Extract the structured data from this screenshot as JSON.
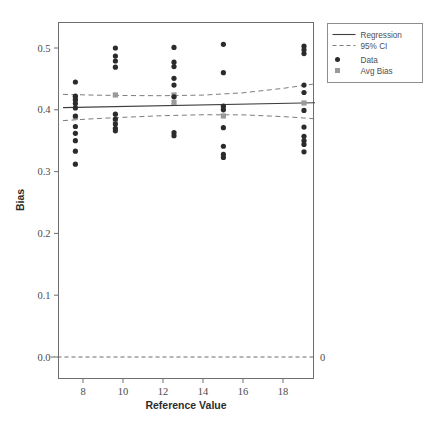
{
  "chart_data": {
    "type": "scatter",
    "title": "",
    "xlabel": "Reference Value",
    "ylabel": "Bias",
    "xlim": [
      6.6,
      19.9
    ],
    "ylim": [
      -0.015,
      0.53
    ],
    "xticks": [
      8,
      10,
      12,
      14,
      16,
      18
    ],
    "xtick_labels": [
      "8",
      "10",
      "12",
      "14",
      "16",
      "18"
    ],
    "yticks": [
      0.0,
      0.1,
      0.2,
      0.3,
      0.4,
      0.5
    ],
    "ytick_labels": [
      "0.0",
      "0.1",
      "0.2",
      "0.3",
      "0.4",
      "0.5"
    ],
    "grid": false,
    "right_axis_label": "0",
    "legend": {
      "position": "top-right-outside",
      "entries": [
        {
          "label": "Regression",
          "marker": "solid-line",
          "color": "#3d3d3d"
        },
        {
          "label": "95% CI",
          "marker": "dashed-line",
          "color": "#7d7d7d"
        },
        {
          "label": "Data",
          "marker": "circle",
          "color": "#2b2b2b"
        },
        {
          "label": "Avg Bias",
          "marker": "square",
          "color": "#9a9a9a"
        }
      ]
    },
    "reference_line": {
      "y": 0.0,
      "style": "dashed",
      "color": "#6b6b6b"
    },
    "series": [
      {
        "name": "Data",
        "marker": "circle",
        "color": "#2b2b2b",
        "points": [
          {
            "x": 7.62,
            "y": 0.445
          },
          {
            "x": 7.62,
            "y": 0.422
          },
          {
            "x": 7.62,
            "y": 0.416
          },
          {
            "x": 7.62,
            "y": 0.41
          },
          {
            "x": 7.62,
            "y": 0.403
          },
          {
            "x": 7.62,
            "y": 0.39
          },
          {
            "x": 7.62,
            "y": 0.373
          },
          {
            "x": 7.62,
            "y": 0.362
          },
          {
            "x": 7.62,
            "y": 0.35
          },
          {
            "x": 7.62,
            "y": 0.333
          },
          {
            "x": 7.62,
            "y": 0.312
          },
          {
            "x": 9.62,
            "y": 0.5
          },
          {
            "x": 9.62,
            "y": 0.487
          },
          {
            "x": 9.62,
            "y": 0.479
          },
          {
            "x": 9.62,
            "y": 0.469
          },
          {
            "x": 9.62,
            "y": 0.393
          },
          {
            "x": 9.62,
            "y": 0.385
          },
          {
            "x": 9.62,
            "y": 0.377
          },
          {
            "x": 9.62,
            "y": 0.37
          },
          {
            "x": 9.62,
            "y": 0.366
          },
          {
            "x": 12.55,
            "y": 0.501
          },
          {
            "x": 12.55,
            "y": 0.477
          },
          {
            "x": 12.55,
            "y": 0.47
          },
          {
            "x": 12.55,
            "y": 0.451
          },
          {
            "x": 12.55,
            "y": 0.44
          },
          {
            "x": 12.55,
            "y": 0.421
          },
          {
            "x": 12.55,
            "y": 0.363
          },
          {
            "x": 12.55,
            "y": 0.358
          },
          {
            "x": 15.02,
            "y": 0.506
          },
          {
            "x": 15.02,
            "y": 0.46
          },
          {
            "x": 15.02,
            "y": 0.406
          },
          {
            "x": 15.02,
            "y": 0.4
          },
          {
            "x": 15.02,
            "y": 0.371
          },
          {
            "x": 15.02,
            "y": 0.341
          },
          {
            "x": 15.02,
            "y": 0.328
          },
          {
            "x": 15.02,
            "y": 0.323
          },
          {
            "x": 19.05,
            "y": 0.503
          },
          {
            "x": 19.05,
            "y": 0.497
          },
          {
            "x": 19.05,
            "y": 0.491
          },
          {
            "x": 19.05,
            "y": 0.44
          },
          {
            "x": 19.05,
            "y": 0.428
          },
          {
            "x": 19.05,
            "y": 0.399
          },
          {
            "x": 19.05,
            "y": 0.372
          },
          {
            "x": 19.05,
            "y": 0.357
          },
          {
            "x": 19.05,
            "y": 0.35
          },
          {
            "x": 19.05,
            "y": 0.344
          },
          {
            "x": 19.05,
            "y": 0.332
          }
        ]
      },
      {
        "name": "Avg Bias",
        "marker": "square",
        "color": "#9a9a9a",
        "points": [
          {
            "x": 7.62,
            "y": 0.419
          },
          {
            "x": 7.62,
            "y": 0.388
          },
          {
            "x": 9.62,
            "y": 0.424
          },
          {
            "x": 9.62,
            "y": 0.383
          },
          {
            "x": 12.55,
            "y": 0.424
          },
          {
            "x": 12.55,
            "y": 0.412
          },
          {
            "x": 15.02,
            "y": 0.404
          },
          {
            "x": 15.02,
            "y": 0.39
          },
          {
            "x": 19.05,
            "y": 0.411
          }
        ]
      }
    ],
    "regression": {
      "name": "Regression",
      "color": "#3d3d3d",
      "x": [
        7.0,
        19.6
      ],
      "y": [
        0.4035,
        0.4115
      ]
    },
    "ci_upper": {
      "name": "95% CI upper",
      "color": "#7d7d7d",
      "x": [
        7.0,
        8.5,
        10.0,
        12.0,
        14.0,
        16.0,
        18.0,
        19.6
      ],
      "y": [
        0.425,
        0.4238,
        0.4231,
        0.4228,
        0.4238,
        0.4275,
        0.4347,
        0.442
      ]
    },
    "ci_lower": {
      "name": "95% CI lower",
      "color": "#7d7d7d",
      "x": [
        7.0,
        8.5,
        10.0,
        12.0,
        14.0,
        16.0,
        18.0,
        19.6
      ],
      "y": [
        0.3825,
        0.3855,
        0.3878,
        0.3905,
        0.392,
        0.3918,
        0.389,
        0.3855
      ]
    }
  }
}
